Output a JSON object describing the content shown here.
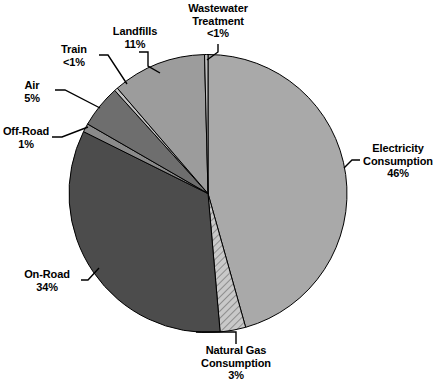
{
  "chart_data": {
    "type": "pie",
    "title": "",
    "subtitle": "",
    "xlabel": "",
    "ylabel": "",
    "legend_position": "none",
    "grid": false,
    "labels_show_percent": true,
    "start_angle_deg": 0,
    "direction": "clockwise",
    "categories": [
      "Electricity Consumption",
      "Natural Gas Consumption",
      "On-Road",
      "Off-Road",
      "Air",
      "Train",
      "Landfills",
      "Wastewater Treatment"
    ],
    "values": [
      46,
      3,
      34,
      1,
      5,
      0.4,
      11,
      0.4
    ],
    "value_labels": [
      "46%",
      "3%",
      "34%",
      "1%",
      "5%",
      "<1%",
      "11%",
      "<1%"
    ],
    "slices": [
      {
        "name": "Electricity Consumption",
        "label_line1": "Electricity",
        "label_line2": "Consumption",
        "value_label": "46%",
        "value": 46,
        "color": "#a9a9a9",
        "pattern": "solid"
      },
      {
        "name": "Natural Gas Consumption",
        "label_line1": "Natural Gas",
        "label_line2": "Consumption",
        "value_label": "3%",
        "value": 3,
        "color": "#b4b4b4",
        "pattern": "diagonal-hatch"
      },
      {
        "name": "On-Road",
        "label_line1": "On-Road",
        "label_line2": "",
        "value_label": "34%",
        "value": 34,
        "color": "#4c4c4c",
        "pattern": "solid"
      },
      {
        "name": "Off-Road",
        "label_line1": "Off-Road",
        "label_line2": "",
        "value_label": "1%",
        "value": 1,
        "color": "#8a8a8a",
        "pattern": "solid"
      },
      {
        "name": "Air",
        "label_line1": "Air",
        "label_line2": "",
        "value_label": "5%",
        "value": 5,
        "color": "#6e6e6e",
        "pattern": "solid"
      },
      {
        "name": "Train",
        "label_line1": "Train",
        "label_line2": "",
        "value_label": "<1%",
        "value": 0.4,
        "color": "#c4c4c4",
        "pattern": "solid"
      },
      {
        "name": "Landfills",
        "label_line1": "Landfills",
        "label_line2": "",
        "value_label": "11%",
        "value": 11,
        "color": "#9c9c9c",
        "pattern": "solid"
      },
      {
        "name": "Wastewater Treatment",
        "label_line1": "Wastewater",
        "label_line2": "Treatment",
        "value_label": "<1%",
        "value": 0.4,
        "color": "#bfbfbf",
        "pattern": "solid"
      }
    ]
  },
  "labels": {
    "wastewater": {
      "l1": "Wastewater",
      "l2": "Treatment",
      "l3": "<1%"
    },
    "landfills": {
      "l1": "Landfills",
      "l2": "11%"
    },
    "train": {
      "l1": "Train",
      "l2": "<1%"
    },
    "air": {
      "l1": "Air",
      "l2": "5%"
    },
    "offroad": {
      "l1": "Off-Road",
      "l2": "1%"
    },
    "onroad": {
      "l1": "On-Road",
      "l2": "34%"
    },
    "naturalgas": {
      "l1": "Natural Gas",
      "l2": "Consumption",
      "l3": "3%"
    },
    "electricity": {
      "l1": "Electricity",
      "l2": "Consumption",
      "l3": "46%"
    }
  }
}
